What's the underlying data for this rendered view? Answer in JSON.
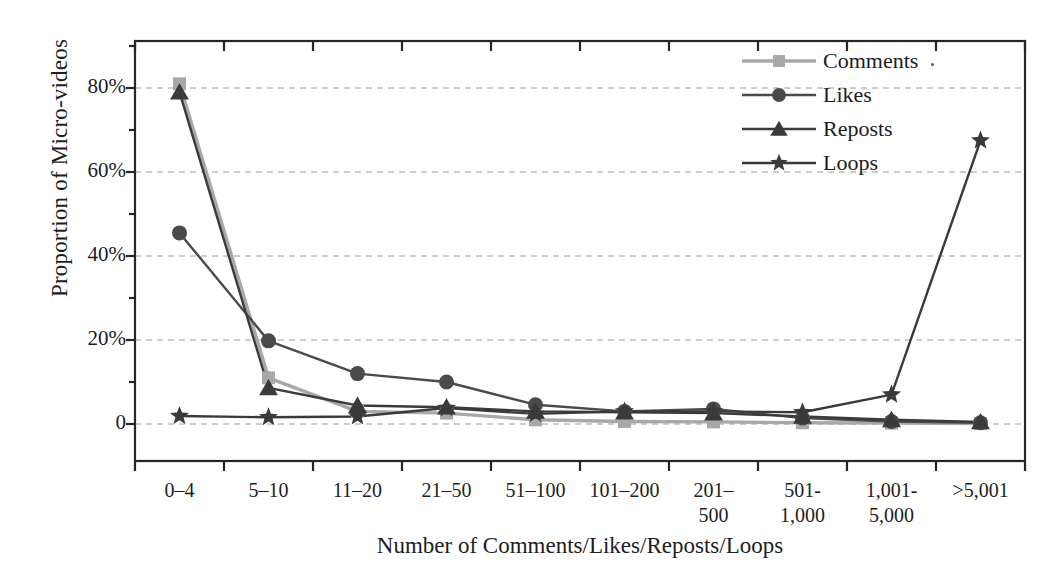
{
  "chart_data": {
    "type": "line",
    "title": "",
    "xlabel": "Number of Comments/Likes/Reposts/Loops",
    "ylabel": "Proportion of Micro-videos",
    "categories": [
      "0–4",
      "5–10",
      "11–20",
      "21–50",
      "51–100",
      "101–200",
      "201–500",
      "501-1,000",
      "1,001-5,000",
      ">5,001"
    ],
    "category_lines": [
      [
        "0–4"
      ],
      [
        "5–10"
      ],
      [
        "11–20"
      ],
      [
        "21–50"
      ],
      [
        "51–100"
      ],
      [
        "101–200"
      ],
      [
        "201–",
        "500"
      ],
      [
        "501-",
        "1,000"
      ],
      [
        "1,001-",
        "5,000"
      ],
      [
        ">5,001"
      ]
    ],
    "ytick_labels": [
      "0",
      "20%",
      "40%",
      "60%",
      "80%"
    ],
    "ytick_values": [
      0,
      20,
      40,
      60,
      80
    ],
    "ylim": [
      -4,
      92
    ],
    "grid": "horizontal-dashed",
    "legend_position": "top-right",
    "series": [
      {
        "name": "Comments",
        "marker": "square",
        "color": "#a8a8a8",
        "values": [
          81.0,
          11.0,
          3.0,
          2.6,
          1.0,
          0.6,
          0.5,
          0.3,
          0.2,
          0.1
        ]
      },
      {
        "name": "Likes",
        "marker": "circle",
        "color": "#4a4a4a",
        "values": [
          45.5,
          19.8,
          12.0,
          10.0,
          4.6,
          3.0,
          3.6,
          1.4,
          0.6,
          0.3
        ]
      },
      {
        "name": "Reposts",
        "marker": "triangle",
        "color": "#3a3a3a",
        "values": [
          79.0,
          8.6,
          4.4,
          4.0,
          3.0,
          2.8,
          2.6,
          1.8,
          1.0,
          0.5
        ]
      },
      {
        "name": "Loops",
        "marker": "star",
        "color": "#3a3a3a",
        "values": [
          1.9,
          1.6,
          1.8,
          3.8,
          2.4,
          3.0,
          3.0,
          2.8,
          7.0,
          67.5
        ]
      }
    ]
  },
  "axis": {
    "y_label_text": "Proportion of Micro-videos",
    "x_label_text": "Number of Comments/Likes/Reposts/Loops"
  }
}
